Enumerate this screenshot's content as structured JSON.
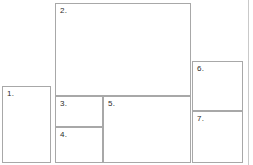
{
  "canvas": {
    "width": 253,
    "height": 165,
    "background": "#ffffff",
    "line_color": "#a8a8a8",
    "label_color": "#2b2b2b",
    "edge_rule_color": "#c9c9c9",
    "edge_rule_x": 248
  },
  "diagram": {
    "title": "",
    "regions": [
      {
        "id": "region-1",
        "label": "1.",
        "x": 2,
        "y": 86,
        "width": 49,
        "height": 77
      },
      {
        "id": "region-2",
        "label": "2.",
        "x": 55,
        "y": 3,
        "width": 136,
        "height": 93
      },
      {
        "id": "region-3",
        "label": "3.",
        "x": 55,
        "y": 96,
        "width": 48,
        "height": 31
      },
      {
        "id": "region-4",
        "label": "4.",
        "x": 55,
        "y": 127,
        "width": 48,
        "height": 36
      },
      {
        "id": "region-5",
        "label": "5.",
        "x": 103,
        "y": 96,
        "width": 88,
        "height": 67
      },
      {
        "id": "region-6",
        "label": "6.",
        "x": 192,
        "y": 61,
        "width": 51,
        "height": 50
      },
      {
        "id": "region-7",
        "label": "7.",
        "x": 192,
        "y": 111,
        "width": 51,
        "height": 52
      }
    ]
  }
}
